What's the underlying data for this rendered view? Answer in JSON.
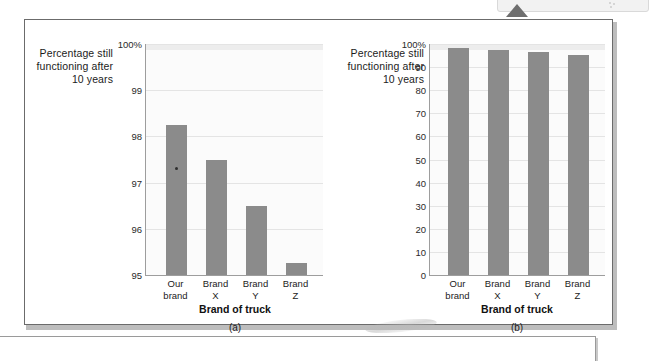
{
  "document": {
    "figures": [
      {
        "id": "a",
        "caption": "(a)",
        "ylabel": "Percentage still functioning after 10 years",
        "xlabel": "Brand of truck"
      },
      {
        "id": "b",
        "caption": "(b)",
        "ylabel": "Percentage still functioning after 10 years",
        "xlabel": "Brand of truck"
      }
    ]
  },
  "chart_data": [
    {
      "type": "bar",
      "title": "",
      "panel": "(a)",
      "categories": [
        "Our brand",
        "Brand X",
        "Brand Y",
        "Brand Z"
      ],
      "category_lines": [
        [
          "Our",
          "brand"
        ],
        [
          "Brand",
          "X"
        ],
        [
          "Brand",
          "Y"
        ],
        [
          "Brand",
          "Z"
        ]
      ],
      "values": [
        98.25,
        97.5,
        96.5,
        95.25
      ],
      "xlabel": "Brand of truck",
      "ylabel": "Percentage still functioning after 10 years",
      "ylim": [
        95,
        100
      ],
      "yticks": [
        95,
        96,
        97,
        98,
        99,
        100
      ],
      "ytick_labels": [
        "95",
        "96",
        "97",
        "98",
        "99",
        "100%"
      ],
      "grid": true,
      "legend": "none",
      "bar_color": "#8b8b8b",
      "note": "Truncated y-axis exaggerates the differences between brands"
    },
    {
      "type": "bar",
      "title": "",
      "panel": "(b)",
      "categories": [
        "Our brand",
        "Brand X",
        "Brand Y",
        "Brand Z"
      ],
      "category_lines": [
        [
          "Our",
          "brand"
        ],
        [
          "Brand",
          "X"
        ],
        [
          "Brand",
          "Y"
        ],
        [
          "Brand",
          "Z"
        ]
      ],
      "values": [
        98.25,
        97.5,
        96.5,
        95.25
      ],
      "xlabel": "Brand of truck",
      "ylabel": "Percentage still functioning after 10 years",
      "ylim": [
        0,
        100
      ],
      "yticks": [
        0,
        10,
        20,
        30,
        40,
        50,
        60,
        70,
        80,
        90,
        100
      ],
      "ytick_labels": [
        "0",
        "10",
        "20",
        "30",
        "40",
        "50",
        "60",
        "70",
        "80",
        "90",
        "100%"
      ],
      "grid": true,
      "legend": "none",
      "bar_color": "#8b8b8b",
      "note": "Full y-axis from zero shows the brands are nearly identical"
    }
  ]
}
